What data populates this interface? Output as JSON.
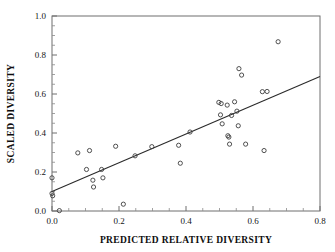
{
  "chart_data": {
    "type": "scatter",
    "title": "",
    "xlabel": "PREDICTED RELATIVE DIVERSITY",
    "ylabel": "SCALED DIVERSITY",
    "xlim": [
      0.0,
      0.8
    ],
    "ylim": [
      0.0,
      1.0
    ],
    "grid": false,
    "legend": "none",
    "x_major_ticks": [
      "0.0",
      "0.2",
      "0.4",
      "0.6",
      "0.8"
    ],
    "x_major_values": [
      0.0,
      0.2,
      0.4,
      0.6,
      0.8
    ],
    "x_minor_step": 0.05,
    "y_major_ticks": [
      "0.0",
      "0.2",
      "0.4",
      "0.6",
      "0.8",
      "1.0"
    ],
    "y_major_values": [
      0.0,
      0.2,
      0.4,
      0.6,
      0.8,
      1.0
    ],
    "y_minor_step": 0.05,
    "marker": "open-circle",
    "marker_radius_px": 2.1,
    "marker_color": "#3d3d3d",
    "frame_color": "#6f6f6f",
    "points": [
      {
        "x": 0.0,
        "y": 0.17
      },
      {
        "x": 0.0,
        "y": 0.09
      },
      {
        "x": 0.002,
        "y": 0.078
      },
      {
        "x": 0.022,
        "y": 0.002
      },
      {
        "x": 0.077,
        "y": 0.298
      },
      {
        "x": 0.103,
        "y": 0.213
      },
      {
        "x": 0.112,
        "y": 0.31
      },
      {
        "x": 0.122,
        "y": 0.158
      },
      {
        "x": 0.124,
        "y": 0.123
      },
      {
        "x": 0.148,
        "y": 0.213
      },
      {
        "x": 0.152,
        "y": 0.17
      },
      {
        "x": 0.19,
        "y": 0.332
      },
      {
        "x": 0.213,
        "y": 0.035
      },
      {
        "x": 0.248,
        "y": 0.283
      },
      {
        "x": 0.298,
        "y": 0.33
      },
      {
        "x": 0.378,
        "y": 0.337
      },
      {
        "x": 0.383,
        "y": 0.245
      },
      {
        "x": 0.412,
        "y": 0.405
      },
      {
        "x": 0.498,
        "y": 0.557
      },
      {
        "x": 0.505,
        "y": 0.551
      },
      {
        "x": 0.503,
        "y": 0.493
      },
      {
        "x": 0.508,
        "y": 0.447
      },
      {
        "x": 0.523,
        "y": 0.543
      },
      {
        "x": 0.525,
        "y": 0.386
      },
      {
        "x": 0.528,
        "y": 0.379
      },
      {
        "x": 0.53,
        "y": 0.343
      },
      {
        "x": 0.536,
        "y": 0.49
      },
      {
        "x": 0.545,
        "y": 0.56
      },
      {
        "x": 0.552,
        "y": 0.512
      },
      {
        "x": 0.556,
        "y": 0.437
      },
      {
        "x": 0.558,
        "y": 0.73
      },
      {
        "x": 0.566,
        "y": 0.697
      },
      {
        "x": 0.578,
        "y": 0.343
      },
      {
        "x": 0.628,
        "y": 0.612
      },
      {
        "x": 0.633,
        "y": 0.31
      },
      {
        "x": 0.642,
        "y": 0.613
      },
      {
        "x": 0.675,
        "y": 0.868
      }
    ],
    "fit_line": {
      "type": "linear-regression",
      "x_start": 0.0,
      "y_start": 0.1,
      "x_end": 0.8,
      "y_end": 0.69,
      "color": "#2a2a2a"
    }
  }
}
